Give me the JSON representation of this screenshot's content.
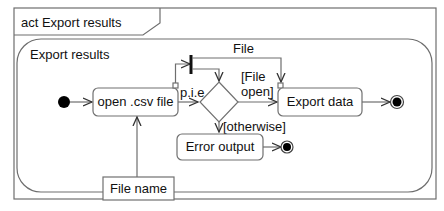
{
  "diagram": {
    "frame_title": "act Export results",
    "region_title": "Export results",
    "actions": [
      {
        "id": "open_csv",
        "label": "open .csv file"
      },
      {
        "id": "export_data",
        "label": "Export data"
      },
      {
        "id": "error_output",
        "label": "Error output"
      }
    ],
    "object_nodes": [
      {
        "id": "file_name",
        "label": "File name"
      }
    ],
    "edge_labels": {
      "file_flow": "File",
      "pie": "p.i.e",
      "guard_file_open_line1": "[File",
      "guard_file_open_line2": "open]",
      "guard_otherwise": "[otherwise]"
    },
    "colors": {
      "line": "#6e6e6e",
      "node_fill": "#000000",
      "background": "#ffffff"
    }
  }
}
